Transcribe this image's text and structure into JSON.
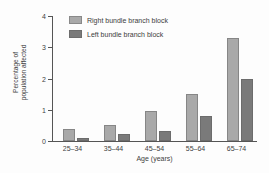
{
  "chart_data": {
    "type": "bar",
    "title": "",
    "subtitle": "",
    "xlabel": "Age (years)",
    "ylabel": "Percentage of population affected",
    "ylabel_line1": "Percentage of",
    "ylabel_line2": "population affected",
    "categories": [
      "25–34",
      "35–44",
      "45–54",
      "55–64",
      "65–74"
    ],
    "series": [
      {
        "name": "Right bundle branch block",
        "color": "#a9a9a9",
        "values": [
          0.4,
          0.5,
          0.95,
          1.5,
          3.3
        ]
      },
      {
        "name": "Left bundle branch block",
        "color": "#7a7a7a",
        "values": [
          0.1,
          0.22,
          0.33,
          0.8,
          2.0
        ]
      }
    ],
    "ylim": [
      0,
      4
    ],
    "yticks": [
      0,
      1,
      2,
      3,
      4
    ],
    "ytick_labels": [
      "0",
      "1",
      "2",
      "3",
      "4"
    ],
    "grid": false,
    "legend_position": "top-left-inside"
  },
  "legend": {
    "entries": [
      {
        "label": "Right bundle branch block",
        "color": "#a9a9a9"
      },
      {
        "label": "Left bundle branch block",
        "color": "#7a7a7a"
      }
    ]
  },
  "colors": {
    "right_bundle": "#a9a9a9",
    "left_bundle": "#7a7a7a",
    "axis": "#555555",
    "text": "#3f3f3f",
    "background": "#fdfdfd"
  }
}
